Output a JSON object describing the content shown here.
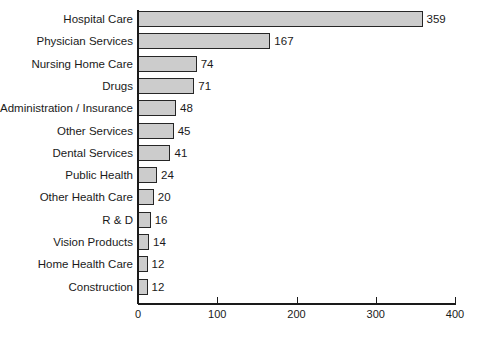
{
  "chart_data": {
    "type": "bar",
    "orientation": "horizontal",
    "title": "",
    "subtitle": "",
    "xlabel": "",
    "ylabel": "",
    "xlim": [
      0,
      400
    ],
    "xticks": [
      0,
      100,
      200,
      300,
      400
    ],
    "xtick_labels": [
      "0",
      "100",
      "200",
      "300",
      "400"
    ],
    "grid": false,
    "legend": null,
    "bar_fill_color": "#cccccc",
    "bar_edge_color": "#262626",
    "categories": [
      "Hospital Care",
      "Physician Services",
      "Nursing Home Care",
      "Drugs",
      "Administration / Insurance",
      "Other Services",
      "Dental Services",
      "Public Health",
      "Other Health Care",
      "R & D",
      "Vision Products",
      "Home Health Care",
      "Construction"
    ],
    "values": [
      359,
      167,
      74,
      71,
      48,
      45,
      41,
      24,
      20,
      16,
      14,
      12,
      12
    ],
    "value_labels": [
      "359",
      "167",
      "74",
      "71",
      "48",
      "45",
      "41",
      "24",
      "20",
      "16",
      "14",
      "12",
      "12"
    ]
  }
}
